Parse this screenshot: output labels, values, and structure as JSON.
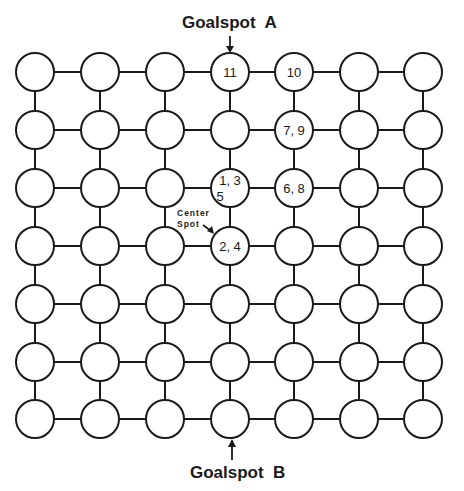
{
  "diagram": {
    "type": "grid-graph",
    "rows": 7,
    "cols": 7,
    "col_x": [
      35,
      100,
      165,
      230,
      294,
      359,
      423
    ],
    "row_y": [
      72,
      130,
      188,
      246,
      304,
      362,
      419
    ],
    "node_radius": 19,
    "node_labels": [
      {
        "row": 0,
        "col": 3,
        "lines": [
          "11"
        ]
      },
      {
        "row": 0,
        "col": 4,
        "lines": [
          "10"
        ]
      },
      {
        "row": 1,
        "col": 4,
        "lines": [
          "7, 9"
        ]
      },
      {
        "row": 2,
        "col": 3,
        "lines": [
          "1,  3",
          "5"
        ]
      },
      {
        "row": 2,
        "col": 4,
        "lines": [
          "6, 8"
        ]
      },
      {
        "row": 3,
        "col": 3,
        "lines": [
          "2,  4"
        ]
      }
    ],
    "goalspot_a": {
      "label": "Goalspot  A",
      "col": 3,
      "row": 0
    },
    "goalspot_b": {
      "label": "Goalspot  B",
      "col": 3,
      "row": 6
    },
    "center_spot": {
      "line1": "Center",
      "line2": "Spot",
      "points_to": {
        "row": 3,
        "col": 3
      }
    }
  }
}
